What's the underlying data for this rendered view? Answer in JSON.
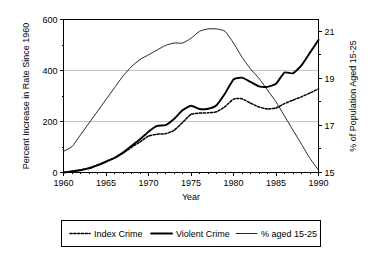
{
  "chart_data": {
    "type": "line",
    "title": "",
    "xlabel": "Year",
    "ylabel": "Percent Increase in Rate Since 1960",
    "y2label": "% of Population Aged 15-25",
    "xlim": [
      1960,
      1990
    ],
    "ylim": [
      0,
      600
    ],
    "y2lim": [
      15,
      21.5
    ],
    "xticks": [
      1960,
      1965,
      1970,
      1975,
      1980,
      1985,
      1990
    ],
    "xtick_labels": [
      "1960",
      "1965",
      "1970",
      "1975",
      "1980",
      "1985",
      "1990"
    ],
    "yticks": [
      0,
      200,
      400,
      600
    ],
    "ytick_labels": [
      "0",
      "200",
      "400",
      "600"
    ],
    "y2ticks": [
      15,
      17,
      19,
      21
    ],
    "y2tick_labels": [
      "15",
      "17",
      "19",
      "21"
    ],
    "y2_minor_ticks": [
      16,
      18,
      20
    ],
    "grid": "horizontal-at-200-400",
    "legend_position": "below-center",
    "x": [
      1960,
      1961,
      1962,
      1963,
      1964,
      1965,
      1966,
      1967,
      1968,
      1969,
      1970,
      1971,
      1972,
      1973,
      1974,
      1975,
      1976,
      1977,
      1978,
      1979,
      1980,
      1981,
      1982,
      1983,
      1984,
      1985,
      1986,
      1987,
      1988,
      1989,
      1990
    ],
    "series": [
      {
        "name": "Index Crime",
        "style": "dotted",
        "axis": "left",
        "values": [
          0,
          5,
          10,
          18,
          30,
          44,
          58,
          76,
          99,
          120,
          143,
          150,
          152,
          165,
          196,
          228,
          233,
          234,
          238,
          258,
          288,
          289,
          272,
          257,
          249,
          253,
          270,
          284,
          297,
          312,
          328
        ]
      },
      {
        "name": "Violent Crime",
        "style": "solid-thick",
        "axis": "left",
        "values": [
          0,
          4,
          9,
          16,
          28,
          42,
          57,
          78,
          104,
          130,
          160,
          183,
          186,
          210,
          244,
          262,
          249,
          250,
          264,
          310,
          365,
          372,
          355,
          338,
          336,
          348,
          392,
          389,
          420,
          470,
          520
        ]
      },
      {
        "name": "% aged 15-25",
        "style": "solid-thin",
        "axis": "right",
        "values": [
          15.9,
          16.1,
          16.6,
          17.1,
          17.6,
          18.1,
          18.6,
          19.1,
          19.5,
          19.8,
          20.0,
          20.2,
          20.4,
          20.5,
          20.5,
          20.7,
          21.0,
          21.1,
          21.1,
          21.0,
          20.5,
          19.9,
          19.4,
          19.0,
          18.5,
          18.0,
          17.4,
          16.8,
          16.2,
          15.6,
          15.1
        ]
      }
    ]
  },
  "legend": {
    "items": [
      {
        "label": "Index Crime",
        "style": "dotted"
      },
      {
        "label": "Violent Crime",
        "style": "solid-thick"
      },
      {
        "label": "% aged 15-25",
        "style": "solid-thin"
      }
    ]
  }
}
